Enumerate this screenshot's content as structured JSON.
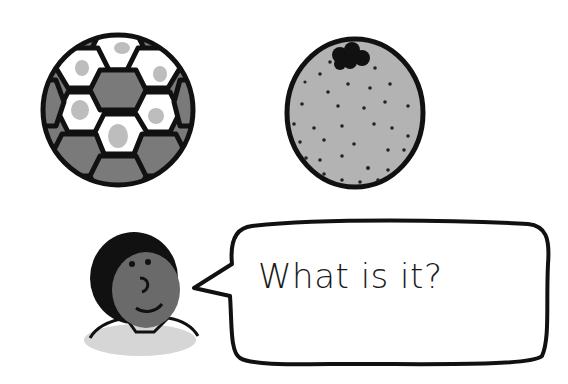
{
  "scene": {
    "items": [
      {
        "id": "soccer-ball",
        "label": "soccer ball"
      },
      {
        "id": "orange",
        "label": "orange"
      }
    ],
    "speaker": {
      "id": "boy"
    },
    "speech_bubble": {
      "text": "What is it?"
    }
  },
  "colors": {
    "outline": "#111111",
    "dark_gray": "#777777",
    "light_gray": "#b5b5b5",
    "skin": "#6a6a6a",
    "white": "#ffffff"
  }
}
